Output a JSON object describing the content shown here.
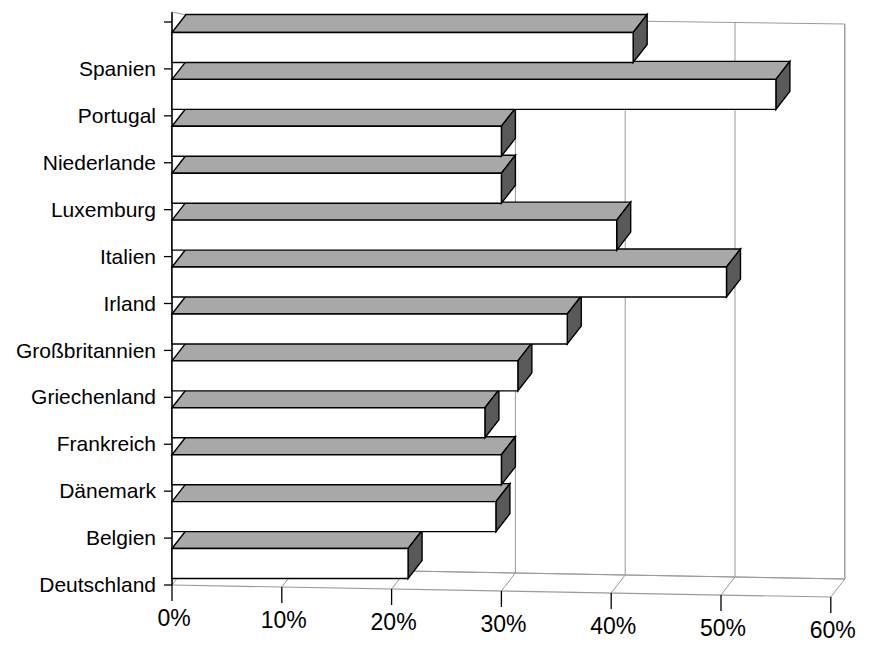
{
  "chart_data": {
    "type": "bar",
    "orientation": "horizontal",
    "style": "3d",
    "title": "",
    "subtitle": "",
    "xlabel": "",
    "ylabel": "",
    "categories": [
      "Spanien",
      "Portugal",
      "Niederlande",
      "Luxemburg",
      "Italien",
      "Irland",
      "Großbritannien",
      "Griechenland",
      "Frankreich",
      "Dänemark",
      "Belgien",
      "Deutschland"
    ],
    "values": [
      42.0,
      55.0,
      30.0,
      30.0,
      40.5,
      50.5,
      36.0,
      31.5,
      28.5,
      30.0,
      29.5,
      21.5
    ],
    "value_unit": "%",
    "xlim": [
      0,
      60
    ],
    "xtick_values": [
      0,
      10,
      20,
      30,
      40,
      50,
      60
    ],
    "xtick_labels": [
      "0%",
      "10%",
      "20%",
      "30%",
      "40%",
      "50%",
      "60%"
    ],
    "grid": true,
    "grid_axis": "x",
    "legend": null,
    "legend_position": "none",
    "annotations": [],
    "series": [
      {
        "name": "Anteil",
        "values": [
          42.0,
          55.0,
          30.0,
          30.0,
          40.5,
          50.5,
          36.0,
          31.5,
          28.5,
          30.0,
          29.5,
          21.5
        ]
      }
    ]
  },
  "colors": {
    "bar_top": "#a8a8a8",
    "bar_front": "#ffffff",
    "bar_side": "#595959",
    "bar_outline": "#000000",
    "grid": "#9a9a9a",
    "axis": "#000000",
    "background": "#ffffff",
    "text": "#000000"
  },
  "caption": {
    "cut_off_line": ""
  }
}
